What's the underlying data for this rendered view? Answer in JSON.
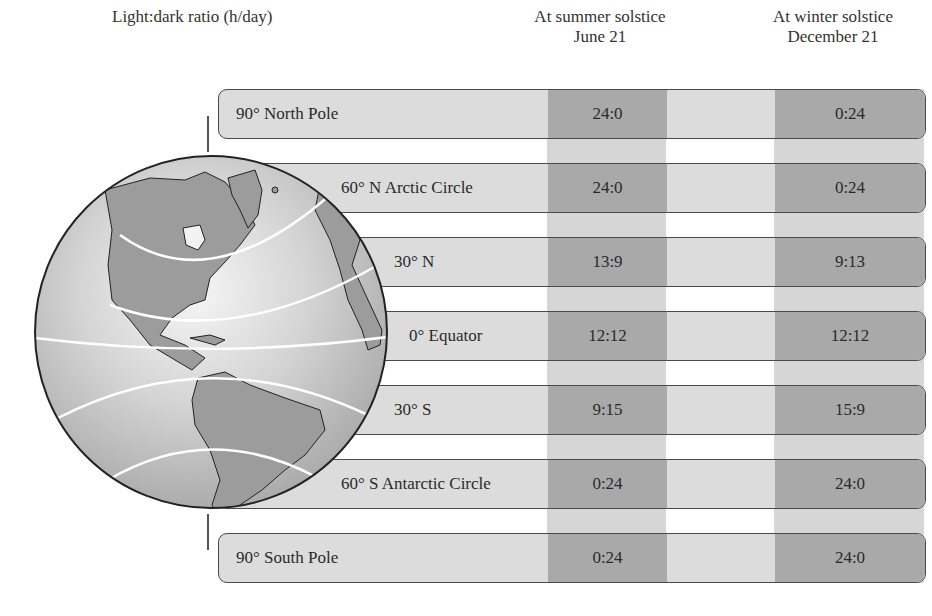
{
  "header": {
    "ratio_label": "Light:dark ratio (h/day)",
    "summer": {
      "line1": "At summer solstice",
      "line2": "June 21"
    },
    "winter": {
      "line1": "At winter solstice",
      "line2": "December 21"
    }
  },
  "rows": [
    {
      "label": "90° North Pole",
      "summer": "24:0",
      "winter": "0:24"
    },
    {
      "label": "60° N Arctic Circle",
      "summer": "24:0",
      "winter": "0:24"
    },
    {
      "label": "30° N",
      "summer": "13:9",
      "winter": "9:13"
    },
    {
      "label": "0° Equator",
      "summer": "12:12",
      "winter": "12:12"
    },
    {
      "label": "30° S",
      "summer": "9:15",
      "winter": "15:9"
    },
    {
      "label": "60° S Antarctic Circle",
      "summer": "0:24",
      "winter": "24:0"
    },
    {
      "label": "90° South Pole",
      "summer": "0:24",
      "winter": "24:0"
    }
  ],
  "colors": {
    "row_bg": "#dcdcdc",
    "dark_band": "#a9a9a9",
    "light_band": "#d6d6d6",
    "border": "#4a4a4a"
  }
}
